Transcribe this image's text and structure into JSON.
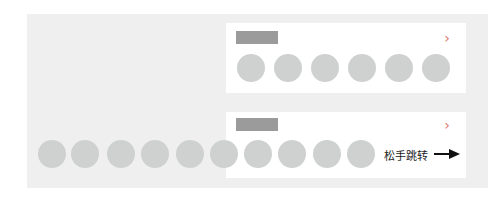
{
  "top_card": {
    "title_placeholder": "",
    "chevron_icon": "chevron-right-icon",
    "item_count": 6
  },
  "bottom_card": {
    "title_placeholder": "",
    "chevron_icon": "chevron-right-icon",
    "item_count": 10,
    "release_hint": "松手跳转",
    "arrow_icon": "arrow-right-icon"
  },
  "colors": {
    "background_panel": "#eeefee",
    "card": "#ffffff",
    "title_placeholder": "#9b9b9b",
    "circle": "#cfd1d1",
    "chevron": "#d9776a",
    "arrow": "#111111"
  }
}
